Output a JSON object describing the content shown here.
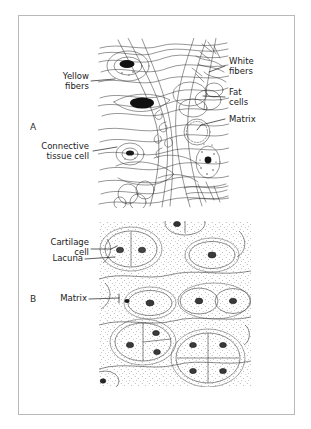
{
  "figure": {
    "background_color": "#ffffff",
    "frame_color": "#b9b9b9",
    "ink_color": "#1a1a1a"
  },
  "panels": [
    {
      "letter": "A",
      "subject": "areolar-connective-tissue",
      "labels": [
        {
          "name": "yellow-fibers",
          "text": "Yellow\nfibers",
          "align": "right"
        },
        {
          "name": "connective-tissue-cell",
          "text": "Connective\ntissue cell",
          "align": "right"
        },
        {
          "name": "white-fibers",
          "text": "White\nfibers",
          "align": "left"
        },
        {
          "name": "fat-cells",
          "text": "Fat\ncells",
          "align": "left"
        },
        {
          "name": "matrix-a",
          "text": "Matrix",
          "align": "left"
        }
      ]
    },
    {
      "letter": "B",
      "subject": "hyaline-cartilage",
      "labels": [
        {
          "name": "cartilage-cell",
          "text": "Cartilage\ncell",
          "align": "right"
        },
        {
          "name": "lacuna",
          "text": "Lacuna",
          "align": "right"
        },
        {
          "name": "matrix-b",
          "text": "Matrix",
          "align": "right"
        }
      ]
    }
  ],
  "text": {
    "panel_a_letter": "A",
    "panel_b_letter": "B",
    "yellow_fibers": "Yellow\nfibers",
    "connective_tissue_cell": "Connective\ntissue cell",
    "white_fibers": "White\nfibers",
    "fat_cells": "Fat\ncells",
    "matrix_a": "Matrix",
    "cartilage_cell": "Cartilage\ncell",
    "lacuna": "Lacuna",
    "matrix_b": "Matrix"
  }
}
